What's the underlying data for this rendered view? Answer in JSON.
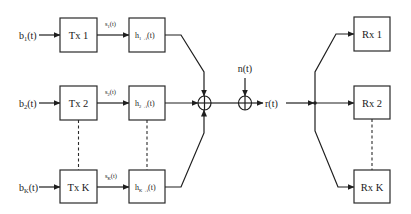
{
  "diagram": {
    "type": "block-diagram",
    "inputs": [
      {
        "label": "b",
        "sub": "1",
        "suffix": "(t)"
      },
      {
        "label": "b",
        "sub": "2",
        "suffix": "(t)"
      },
      {
        "label": "b",
        "sub": "K",
        "suffix": "(t)"
      }
    ],
    "transmitters": [
      {
        "label": "Tx 1"
      },
      {
        "label": "Tx 2"
      },
      {
        "label": "Tx K"
      }
    ],
    "signals": [
      {
        "label": "s",
        "sub": "1",
        "suffix": "(t)"
      },
      {
        "label": "s",
        "sub": "2",
        "suffix": "(t)"
      },
      {
        "label": "s",
        "sub": "K",
        "suffix": "(t)"
      }
    ],
    "channels": [
      {
        "label": "h",
        "sub": "1→i",
        "suffix": "(t)"
      },
      {
        "label": "h",
        "sub": "2→i",
        "suffix": "(t)"
      },
      {
        "label": "h",
        "sub": "K→i",
        "suffix": "(t)"
      }
    ],
    "noise": {
      "label": "n(t)"
    },
    "received": {
      "label": "r(t)"
    },
    "receivers": [
      {
        "label": "Rx 1"
      },
      {
        "label": "Rx 2"
      },
      {
        "label": "Rx K"
      }
    ],
    "summers": [
      {
        "role": "channel-sum",
        "symbol": "⊕"
      },
      {
        "role": "noise-add",
        "symbol": "⊕"
      }
    ],
    "colors": {
      "stroke": "#1f1f1f",
      "background": "#ffffff"
    }
  }
}
